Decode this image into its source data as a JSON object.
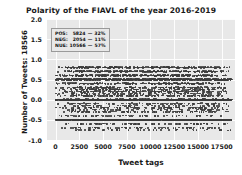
{
  "chart_data": {
    "type": "scatter",
    "title": "Polarity of the FIAVL of the year 2016-2019",
    "xlabel": "Tweet tags",
    "ylabel": "Number of Tweets:  18566",
    "xlim": [
      -900,
      18900
    ],
    "ylim": [
      -1.0,
      2.0
    ],
    "xticks": [
      "0",
      "2500",
      "5000",
      "7500",
      "10000",
      "12500",
      "15000",
      "17500"
    ],
    "xtick_values": [
      0,
      2500,
      5000,
      7500,
      10000,
      12500,
      15000,
      17500
    ],
    "yticks": [
      "2.0",
      "1.5",
      "1.0",
      "0.5",
      "0.0",
      "-0.5",
      "-1.0"
    ],
    "ytick_values": [
      2.0,
      1.5,
      1.0,
      0.5,
      0.0,
      -0.5,
      -1.0
    ],
    "grid": true,
    "legend_position": "upper left",
    "marker_color": "#3b3b3b",
    "plot_background": "#e8e8e8",
    "total_points": 18566,
    "series": [
      {
        "name": "polarity",
        "description": "Sentiment polarity per tweet tag; dense horizontal bands at common TextBlob polarity values.",
        "band_levels": [
          0.0,
          0.5,
          -0.5,
          0.8,
          0.7,
          0.6,
          0.4,
          0.3,
          0.25,
          0.2,
          0.15,
          0.1,
          -0.1,
          -0.15,
          -0.2,
          -0.25,
          -0.3,
          -0.4,
          -0.6,
          -0.7,
          -0.75
        ],
        "band_weights": [
          1.0,
          0.62,
          0.5,
          0.4,
          0.34,
          0.42,
          0.3,
          0.26,
          0.2,
          0.24,
          0.16,
          0.2,
          0.14,
          0.1,
          0.16,
          0.1,
          0.14,
          0.12,
          0.12,
          0.1,
          0.06
        ],
        "x_range": [
          0,
          18566
        ],
        "y_range": [
          -0.8,
          0.85
        ]
      }
    ]
  },
  "legend": {
    "rows": [
      {
        "key": "POS:",
        "count": "5824",
        "dash": "—",
        "pct": "32%"
      },
      {
        "key": "NEG:",
        "count": "2054",
        "dash": "—",
        "pct": "11%"
      },
      {
        "key": "NUE:",
        "count": "10566",
        "dash": "—",
        "pct": "57%"
      }
    ]
  }
}
